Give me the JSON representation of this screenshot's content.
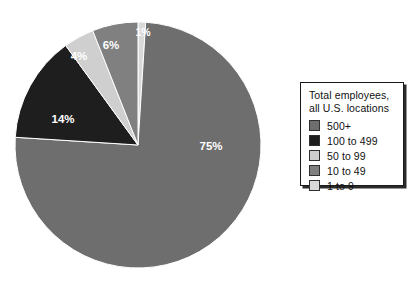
{
  "chart_data": {
    "type": "pie",
    "title": "",
    "legend_title": "Total employees,\nall U.S. locations",
    "legend_position": "right",
    "start_angle_deg": 0,
    "direction": "clockwise",
    "categories": [
      "500+",
      "100 to 499",
      "50 to 99",
      "10 to 49",
      "1 to 9"
    ],
    "values": [
      75,
      14,
      4,
      6,
      1
    ],
    "value_labels": [
      "75%",
      "14%",
      "4%",
      "6%",
      "1%"
    ],
    "units": "percent",
    "colors": [
      "#6e6e6e",
      "#1e1e1e",
      "#cfcfcf",
      "#808080",
      "#d9d9d9"
    ],
    "slices": [
      {
        "name": "1 to 9",
        "label": "1%",
        "value": 1,
        "color": "#d9d9d9",
        "start_deg": 0,
        "end_deg": 3.6,
        "label_x": 143,
        "label_y": 33,
        "label_size": "small"
      },
      {
        "name": "500+",
        "label": "75%",
        "value": 75,
        "color": "#6e6e6e",
        "start_deg": 3.6,
        "end_deg": 273.6,
        "label_x": 211,
        "label_y": 147,
        "label_size": "normal"
      },
      {
        "name": "100 to 499",
        "label": "14%",
        "value": 14,
        "color": "#1e1e1e",
        "start_deg": 273.6,
        "end_deg": 324.0,
        "label_x": 63,
        "label_y": 120,
        "label_size": "normal"
      },
      {
        "name": "50 to 99",
        "label": "4%",
        "value": 4,
        "color": "#cfcfcf",
        "start_deg": 324.0,
        "end_deg": 338.4,
        "label_x": 79,
        "label_y": 57,
        "label_size": "normal"
      },
      {
        "name": "10 to 49",
        "label": "6%",
        "value": 6,
        "color": "#808080",
        "start_deg": 338.4,
        "end_deg": 360.0,
        "label_x": 111,
        "label_y": 46,
        "label_size": "normal"
      }
    ],
    "geometry": {
      "center_x": 138,
      "center_y": 145,
      "radius": 123
    }
  },
  "legend": {
    "title": "Total employees,\nall U.S. locations",
    "items": [
      {
        "label": "500+",
        "color": "#6e6e6e"
      },
      {
        "label": "100 to 499",
        "color": "#1e1e1e"
      },
      {
        "label": "50 to 99",
        "color": "#cfcfcf"
      },
      {
        "label": "10 to 49",
        "color": "#808080"
      },
      {
        "label": "1 to 9",
        "color": "#d9d9d9"
      }
    ]
  }
}
